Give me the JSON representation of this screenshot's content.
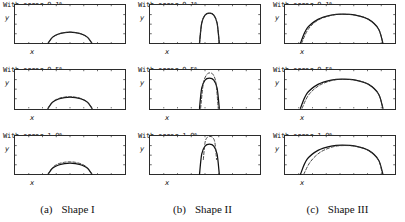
{
  "figure": {
    "rows": [
      {
        "error_label": "With error 0.1%",
        "error_pct": 0.1
      },
      {
        "error_label": "With error 0.5%",
        "error_pct": 0.5
      },
      {
        "error_label": "With error 1.0%",
        "error_pct": 1.0
      }
    ],
    "axis": {
      "x_label": "x",
      "y_label": "y"
    },
    "captions": [
      {
        "tag": "(a)",
        "label": "Shape I"
      },
      {
        "tag": "(b)",
        "label": "Shape II"
      },
      {
        "tag": "(c)",
        "label": "Shape III"
      }
    ],
    "colors": {
      "axis": "#2b2b2b",
      "true_curve": "#111111",
      "reconstructed_curve": "#333333"
    }
  },
  "chart_data": [
    {
      "type": "line",
      "title": "With error 0.1%",
      "panel": "Shape I",
      "xlabel": "x",
      "ylabel": "y",
      "xlim": [
        0,
        10
      ],
      "ylim": [
        0,
        4
      ],
      "grid": false,
      "xticks": [
        0,
        1.25,
        2.5,
        3.75,
        5,
        6.25,
        7.5,
        8.75,
        10
      ],
      "yticks": [
        0,
        1,
        2,
        3,
        4
      ],
      "series": [
        {
          "name": "true shape",
          "style": "solid",
          "x": [
            3.0,
            3.4,
            3.9,
            4.5,
            5.0,
            5.5,
            6.1,
            6.6,
            7.0
          ],
          "y": [
            0.0,
            0.62,
            0.95,
            1.12,
            1.16,
            1.12,
            0.95,
            0.62,
            0.0
          ]
        },
        {
          "name": "reconstruction",
          "style": "dashed",
          "x": [
            3.0,
            3.4,
            3.9,
            4.5,
            5.0,
            5.5,
            6.1,
            6.6,
            7.0
          ],
          "y": [
            0.0,
            0.62,
            0.95,
            1.12,
            1.16,
            1.12,
            0.95,
            0.62,
            0.0
          ]
        }
      ]
    },
    {
      "type": "line",
      "title": "With error 0.1%",
      "panel": "Shape II",
      "xlabel": "x",
      "ylabel": "y",
      "xlim": [
        0,
        10
      ],
      "ylim": [
        0,
        4
      ],
      "grid": false,
      "xticks": [
        0,
        1.25,
        2.5,
        3.75,
        5,
        6.25,
        7.5,
        8.75,
        10
      ],
      "yticks": [
        0,
        1,
        2,
        3,
        4
      ],
      "series": [
        {
          "name": "true shape",
          "style": "solid",
          "x": [
            4.5,
            4.7,
            5.0,
            5.4,
            5.8,
            6.1,
            6.3
          ],
          "y": [
            0.0,
            2.1,
            2.95,
            3.15,
            2.95,
            2.1,
            0.0
          ]
        },
        {
          "name": "reconstruction",
          "style": "dashed",
          "x": [
            4.5,
            4.7,
            5.0,
            5.4,
            5.8,
            6.1,
            6.3
          ],
          "y": [
            0.0,
            2.1,
            2.95,
            3.15,
            2.95,
            2.1,
            0.0
          ]
        }
      ]
    },
    {
      "type": "line",
      "title": "With error 0.1%",
      "panel": "Shape III",
      "xlabel": "x",
      "ylabel": "y",
      "xlim": [
        0,
        10
      ],
      "ylim": [
        0,
        4
      ],
      "grid": false,
      "xticks": [
        0,
        1.25,
        2.5,
        3.75,
        5,
        6.25,
        7.5,
        8.75,
        10
      ],
      "yticks": [
        0,
        1,
        2,
        3,
        4
      ],
      "series": [
        {
          "name": "true shape",
          "style": "solid",
          "x": [
            1.4,
            2.0,
            3.0,
            4.2,
            5.2,
            6.4,
            7.6,
            8.5,
            8.9
          ],
          "y": [
            0.0,
            1.55,
            2.5,
            2.95,
            3.05,
            2.95,
            2.5,
            1.5,
            0.0
          ]
        },
        {
          "name": "reconstruction",
          "style": "dashed",
          "x": [
            1.5,
            2.1,
            3.0,
            4.2,
            5.2,
            6.4,
            7.6,
            8.5,
            8.9
          ],
          "y": [
            0.0,
            1.45,
            2.42,
            2.92,
            3.03,
            2.94,
            2.5,
            1.5,
            0.0
          ]
        }
      ]
    },
    {
      "type": "line",
      "title": "With error 0.5%",
      "panel": "Shape I",
      "xlabel": "x",
      "ylabel": "y",
      "xlim": [
        0,
        10
      ],
      "ylim": [
        0,
        4
      ],
      "grid": false,
      "xticks": [
        0,
        1.25,
        2.5,
        3.75,
        5,
        6.25,
        7.5,
        8.75,
        10
      ],
      "yticks": [
        0,
        1,
        2,
        3,
        4
      ],
      "series": [
        {
          "name": "true shape",
          "style": "solid",
          "x": [
            3.0,
            3.4,
            3.9,
            4.5,
            5.0,
            5.5,
            6.1,
            6.6,
            7.0
          ],
          "y": [
            0.0,
            0.62,
            0.95,
            1.12,
            1.16,
            1.12,
            0.95,
            0.62,
            0.0
          ]
        },
        {
          "name": "reconstruction",
          "style": "dashed",
          "x": [
            3.0,
            3.4,
            3.9,
            4.5,
            5.0,
            5.5,
            6.1,
            6.6,
            7.0
          ],
          "y": [
            0.0,
            0.66,
            1.0,
            1.17,
            1.2,
            1.16,
            0.98,
            0.64,
            0.0
          ]
        }
      ]
    },
    {
      "type": "line",
      "title": "With error 0.5%",
      "panel": "Shape II",
      "xlabel": "x",
      "ylabel": "y",
      "xlim": [
        0,
        10
      ],
      "ylim": [
        0,
        4
      ],
      "grid": false,
      "xticks": [
        0,
        1.25,
        2.5,
        3.75,
        5,
        6.25,
        7.5,
        8.75,
        10
      ],
      "yticks": [
        0,
        1,
        2,
        3,
        4
      ],
      "series": [
        {
          "name": "true shape",
          "style": "solid",
          "x": [
            4.5,
            4.7,
            5.0,
            5.4,
            5.8,
            6.1,
            6.3
          ],
          "y": [
            0.0,
            2.1,
            2.95,
            3.15,
            2.95,
            2.1,
            0.0
          ]
        },
        {
          "name": "reconstruction",
          "style": "dashed",
          "x": [
            4.6,
            4.85,
            5.15,
            5.45,
            5.75,
            6.0,
            6.2
          ],
          "y": [
            0.0,
            2.6,
            3.5,
            3.7,
            3.5,
            2.6,
            0.0
          ]
        }
      ]
    },
    {
      "type": "line",
      "title": "With error 0.5%",
      "panel": "Shape III",
      "xlabel": "x",
      "ylabel": "y",
      "xlim": [
        0,
        10
      ],
      "ylim": [
        0,
        4
      ],
      "grid": false,
      "xticks": [
        0,
        1.25,
        2.5,
        3.75,
        5,
        6.25,
        7.5,
        8.75,
        10
      ],
      "yticks": [
        0,
        1,
        2,
        3,
        4
      ],
      "series": [
        {
          "name": "true shape",
          "style": "solid",
          "x": [
            1.4,
            2.0,
            3.0,
            4.2,
            5.2,
            6.4,
            7.6,
            8.5,
            8.9
          ],
          "y": [
            0.0,
            1.55,
            2.5,
            2.95,
            3.05,
            2.95,
            2.5,
            1.5,
            0.0
          ]
        },
        {
          "name": "reconstruction",
          "style": "dashed",
          "x": [
            1.55,
            2.15,
            3.1,
            4.25,
            5.2,
            6.4,
            7.6,
            8.5,
            8.9
          ],
          "y": [
            0.0,
            1.4,
            2.38,
            2.9,
            3.02,
            2.94,
            2.5,
            1.5,
            0.0
          ]
        }
      ]
    },
    {
      "type": "line",
      "title": "With error 1.0%",
      "panel": "Shape I",
      "xlabel": "x",
      "ylabel": "y",
      "xlim": [
        0,
        10
      ],
      "ylim": [
        0,
        4
      ],
      "grid": false,
      "xticks": [
        0,
        1.25,
        2.5,
        3.75,
        5,
        6.25,
        7.5,
        8.75,
        10
      ],
      "yticks": [
        0,
        1,
        2,
        3,
        4
      ],
      "series": [
        {
          "name": "true shape",
          "style": "solid",
          "x": [
            3.0,
            3.4,
            3.9,
            4.5,
            5.0,
            5.5,
            6.1,
            6.6,
            7.0
          ],
          "y": [
            0.0,
            0.62,
            0.95,
            1.12,
            1.16,
            1.12,
            0.95,
            0.62,
            0.0
          ]
        },
        {
          "name": "reconstruction",
          "style": "dashed",
          "x": [
            3.0,
            3.4,
            3.9,
            4.5,
            5.0,
            5.5,
            6.1,
            6.6,
            7.0
          ],
          "y": [
            0.0,
            0.7,
            1.08,
            1.26,
            1.3,
            1.25,
            1.05,
            0.68,
            0.0
          ]
        }
      ]
    },
    {
      "type": "line",
      "title": "With error 1.0%",
      "panel": "Shape II",
      "xlabel": "x",
      "ylabel": "y",
      "xlim": [
        0,
        10
      ],
      "ylim": [
        0,
        4
      ],
      "grid": false,
      "xticks": [
        0,
        1.25,
        2.5,
        3.75,
        5,
        6.25,
        7.5,
        8.75,
        10
      ],
      "yticks": [
        0,
        1,
        2,
        3,
        4
      ],
      "series": [
        {
          "name": "true shape",
          "style": "solid",
          "x": [
            4.5,
            4.7,
            5.0,
            5.4,
            5.8,
            6.1,
            6.3
          ],
          "y": [
            0.0,
            2.1,
            2.95,
            3.15,
            2.95,
            2.1,
            0.0
          ]
        },
        {
          "name": "reconstruction",
          "style": "dashed",
          "x": [
            4.85,
            5.0,
            5.2,
            5.45,
            5.7,
            5.9,
            6.05
          ],
          "y": [
            1.55,
            3.3,
            3.85,
            3.95,
            3.85,
            3.3,
            1.55
          ]
        }
      ]
    },
    {
      "type": "line",
      "title": "With error 1.0%",
      "panel": "Shape III",
      "xlabel": "x",
      "ylabel": "y",
      "xlim": [
        0,
        10
      ],
      "ylim": [
        0,
        4
      ],
      "grid": false,
      "xticks": [
        0,
        1.25,
        2.5,
        3.75,
        5,
        6.25,
        7.5,
        8.75,
        10
      ],
      "yticks": [
        0,
        1,
        2,
        3,
        4
      ],
      "series": [
        {
          "name": "true shape",
          "style": "solid",
          "x": [
            1.4,
            2.0,
            3.0,
            4.2,
            5.2,
            6.4,
            7.6,
            8.5,
            8.9
          ],
          "y": [
            0.0,
            1.55,
            2.5,
            2.95,
            3.05,
            2.95,
            2.5,
            1.5,
            0.0
          ]
        },
        {
          "name": "reconstruction",
          "style": "dashed",
          "x": [
            1.7,
            2.3,
            3.2,
            4.3,
            5.25,
            6.45,
            7.6,
            8.5,
            8.85
          ],
          "y": [
            0.0,
            1.3,
            2.3,
            2.85,
            3.0,
            2.92,
            2.48,
            1.48,
            0.0
          ]
        }
      ]
    }
  ]
}
